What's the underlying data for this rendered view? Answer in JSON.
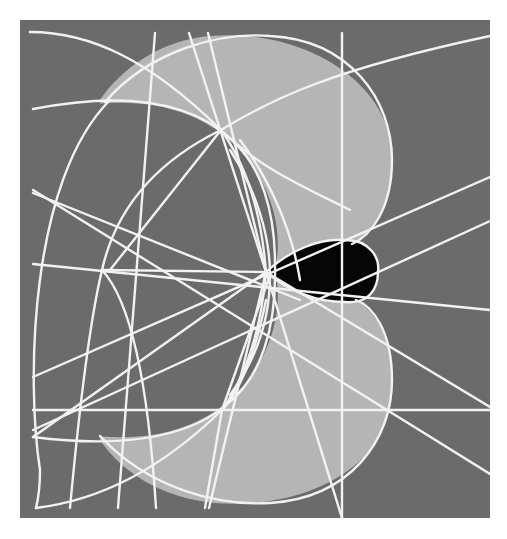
{
  "diagram": {
    "frame": {
      "x": 20,
      "y": 20,
      "width": 470,
      "height": 498
    },
    "colors": {
      "page_bg": "#ffffff",
      "frame_bg": "#6b6b6b",
      "light_region": "#b5b5b5",
      "dark_region": "#6b6b6b",
      "black_region": "#050505",
      "line": "#f2f2f2"
    },
    "line_width": 2.4,
    "regions": [
      {
        "name": "light-lobes-union",
        "fill": "light_region",
        "d": "M 210 36 C 300 28 392 80 392 158 C 392 210 372 236 352 244 C 372 262 374 290 356 300 C 380 316 392 340 392 388 C 392 470 300 510 215 503 C 160 498 120 470 100 440 L 100 100 C 120 70 160 40 210 36 Z"
      },
      {
        "name": "dark-disk",
        "fill": "dark_region",
        "d": "M 80 106 C 150 95 220 110 258 175 C 276 205 282 240 275 270 C 282 300 276 335 258 365 C 220 430 150 445 80 434 C 30 360 30 180 80 106 Z"
      },
      {
        "name": "black-teardrop",
        "fill": "black_region",
        "d": "M 266 272 C 290 250 320 238 345 240 C 370 240 380 258 378 272 C 378 290 368 304 345 302 C 318 302 290 292 266 272 Z"
      }
    ],
    "arcs": [
      {
        "name": "outer-left-arc",
        "d": "M 110 100 C 30 180 26 380 40 470 C 40 490 38 500 36 508"
      },
      {
        "name": "upper-light-circle",
        "d": "M 105 102 C 150 50 220 32 270 36 C 350 40 392 100 392 160 C 392 210 370 236 352 244"
      },
      {
        "name": "lower-light-circle",
        "d": "M 100 436 C 150 490 220 506 270 503 C 350 498 392 440 392 380 C 392 330 372 306 356 300"
      },
      {
        "name": "dark-disk-upper-edge",
        "d": "M 33 109 C 120 92 190 100 232 140 C 260 165 276 210 275 270"
      },
      {
        "name": "dark-disk-lower-edge",
        "d": "M 33 437 C 120 448 190 440 232 400 C 260 375 276 330 275 270"
      },
      {
        "name": "top-left-arc",
        "d": "M 30 32 C 90 32 150 60 221 130 C 260 168 300 185 350 210"
      },
      {
        "name": "bottom-left-arc",
        "d": "M 36 508 C 100 500 160 470 222 410 C 245 385 258 340 266 300"
      },
      {
        "name": "top-right-arc",
        "d": "M 221 130 C 270 100 330 70 490 36"
      },
      {
        "name": "inner-left-curve",
        "d": "M 221 130 C 180 150 120 190 102 270 C 90 320 80 400 70 508"
      },
      {
        "name": "inner-lower-curve",
        "d": "M 102 270 C 130 300 148 380 156 508"
      },
      {
        "name": "teardrop-upper-edge",
        "d": "M 266 272 C 290 250 320 238 345 240 C 370 240 380 258 378 272"
      },
      {
        "name": "teardrop-lower-edge",
        "d": "M 266 272 C 290 292 318 302 345 302 C 368 304 378 290 378 272"
      },
      {
        "name": "center-bend-upper",
        "d": "M 221 130 C 250 170 262 220 266 272"
      },
      {
        "name": "center-bend-lower",
        "d": "M 222 410 C 250 370 262 320 266 272"
      },
      {
        "name": "center-arc-a",
        "d": "M 230 150 C 256 190 270 235 270 275 C 270 320 256 360 230 395"
      },
      {
        "name": "center-arc-b",
        "d": "M 240 140 C 270 180 292 230 300 280"
      }
    ],
    "lines": [
      {
        "name": "vertical-right",
        "x1": 342,
        "y1": 33,
        "x2": 342,
        "y2": 518
      },
      {
        "name": "horizontal-bottom",
        "x1": 33,
        "y1": 410,
        "x2": 490,
        "y2": 410
      },
      {
        "name": "top-diag-1",
        "x1": 155,
        "y1": 33,
        "x2": 118,
        "y2": 508
      },
      {
        "name": "top-diag-2",
        "x1": 189,
        "y1": 33,
        "x2": 266,
        "y2": 272
      },
      {
        "name": "top-diag-3",
        "x1": 208,
        "y1": 33,
        "x2": 266,
        "y2": 272
      },
      {
        "name": "bottom-diag-1",
        "x1": 266,
        "y1": 272,
        "x2": 342,
        "y2": 518
      },
      {
        "name": "bottom-diag-2",
        "x1": 266,
        "y1": 272,
        "x2": 209,
        "y2": 508
      },
      {
        "name": "left-ray-1",
        "x1": 33,
        "y1": 190,
        "x2": 490,
        "y2": 474
      },
      {
        "name": "left-ray-2",
        "x1": 33,
        "y1": 193,
        "x2": 300,
        "y2": 300
      },
      {
        "name": "left-ray-3",
        "x1": 33,
        "y1": 264,
        "x2": 490,
        "y2": 310
      },
      {
        "name": "left-ray-4",
        "x1": 33,
        "y1": 377,
        "x2": 490,
        "y2": 177
      },
      {
        "name": "left-ray-5",
        "x1": 33,
        "y1": 430,
        "x2": 490,
        "y2": 221
      },
      {
        "name": "left-ray-6",
        "x1": 33,
        "y1": 437,
        "x2": 266,
        "y2": 272
      },
      {
        "name": "right-ray-1",
        "x1": 266,
        "y1": 272,
        "x2": 490,
        "y2": 407
      },
      {
        "name": "upper-ray-1",
        "x1": 221,
        "y1": 130,
        "x2": 110,
        "y2": 270
      },
      {
        "name": "upper-ray-2",
        "x1": 102,
        "y1": 270,
        "x2": 266,
        "y2": 272
      },
      {
        "name": "lower-ray-1",
        "x1": 222,
        "y1": 410,
        "x2": 270,
        "y2": 275
      },
      {
        "name": "lower-ray-2",
        "x1": 222,
        "y1": 410,
        "x2": 205,
        "y2": 508
      }
    ],
    "points": [
      {
        "name": "top-convergence",
        "x": 221,
        "y": 130
      },
      {
        "name": "bottom-convergence",
        "x": 222,
        "y": 410
      },
      {
        "name": "left-convergence",
        "x": 102,
        "y": 270
      },
      {
        "name": "center-convergence",
        "x": 266,
        "y": 272
      }
    ]
  }
}
